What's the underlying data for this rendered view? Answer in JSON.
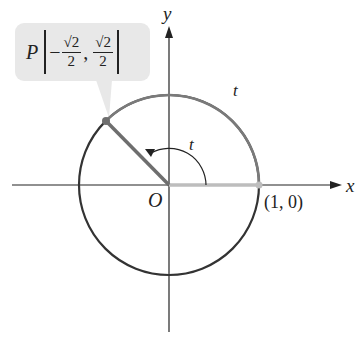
{
  "diagram": {
    "axes": {
      "x_label": "x",
      "y_label": "y",
      "origin_label": "O"
    },
    "point_on_x_axis": {
      "label": "(1, 0)"
    },
    "point_P": {
      "name": "P",
      "x_num": "√2",
      "x_den": "2",
      "x_sign": "−",
      "y_num": "√2",
      "y_den": "2",
      "separator": ","
    },
    "arc_label": "t",
    "angle_label": "t",
    "colors": {
      "circle": "#333333",
      "arc_t": "#7a7a7a",
      "radius_to_P": "#6e6e6e",
      "highlight_segment": "#bdbdbd",
      "callout_bg": "#e8e8e8",
      "axes": "#222222"
    }
  }
}
